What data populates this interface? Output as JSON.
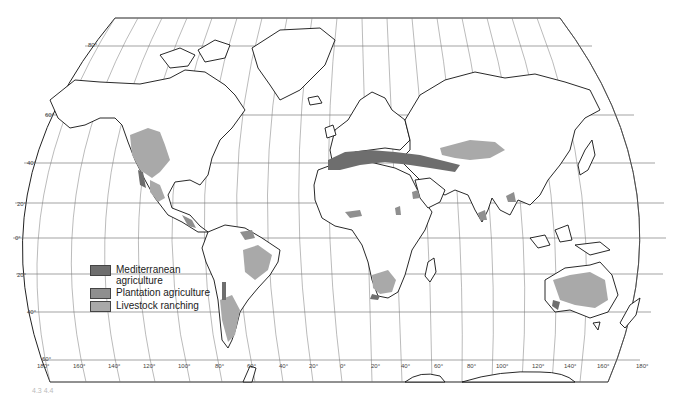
{
  "map": {
    "projection": "pseudo-cylindrical world map",
    "colors": {
      "mediterranean": "#6e6e6e",
      "plantation": "#8f8f8f",
      "livestock": "#a9a9a9",
      "outline": "#111111",
      "graticule": "#555555"
    },
    "latitude_labels": [
      "80°",
      "60°",
      "40°",
      "20°",
      "0°",
      "20°",
      "40°",
      "60°"
    ],
    "longitude_labels": [
      "180°",
      "160°",
      "140°",
      "120°",
      "100°",
      "80°",
      "60°",
      "40°",
      "20°",
      "0°",
      "20°",
      "40°",
      "60°",
      "80°",
      "100°",
      "120°",
      "140°",
      "160°",
      "180°"
    ],
    "regions": {
      "mediterranean_agriculture": [
        "Mediterranean Basin",
        "California coast",
        "Central Chile",
        "South-western Australia",
        "South Africa Cape"
      ],
      "livestock_ranching": [
        "Western North America",
        "Northern Mexico",
        "Eastern Brazil",
        "Argentina / Patagonia",
        "Southern Africa",
        "Central Asia / Kazakhstan",
        "Australia interior"
      ],
      "plantation_agriculture": [
        "Central America",
        "Northern South America",
        "West Africa coast",
        "East Africa highlands",
        "South India / Sri Lanka",
        "Southeast Asia"
      ]
    }
  },
  "legend": {
    "items": [
      {
        "label": "Mediterranean\n    agriculture",
        "color": "#6e6e6e"
      },
      {
        "label": "Plantation agriculture",
        "color": "#8f8f8f"
      },
      {
        "label": "Livestock ranching",
        "color": "#a9a9a9"
      }
    ]
  },
  "caption": "4.3  4.4"
}
